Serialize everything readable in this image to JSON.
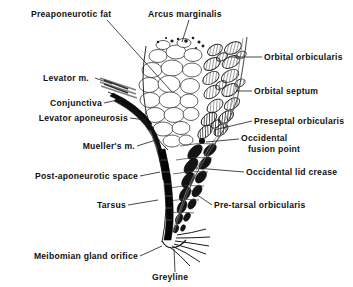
{
  "figure": {
    "background_color": "#ffffff",
    "ink_color": "#111111",
    "labels": {
      "preaponeurotic_fat": "Preaponeurotic fat",
      "arcus_marginalis": "Arcus marginalis",
      "orbital_orbicularis": "Orbital orbicularis",
      "orbital_septum": "Orbital septum",
      "levator_muscle": "Levator m.",
      "conjunctiva": "Conjunctiva",
      "levator_aponeurosis": "Levator aponeurosis",
      "preseptal_orbicularis": "Preseptal orbicularis",
      "muellers_muscle": "Mueller's m.",
      "occidental_fusion_point_line1": "Occidental",
      "occidental_fusion_point_line2": "fusion point",
      "post_aponeurotic_space": "Post-aponeurotic space",
      "occidental_lid_crease": "Occidental lid crease",
      "tarsus": "Tarsus",
      "pre_tarsal_orbicularis": "Pre-tarsal orbicularis",
      "meibomian_gland_orifice": "Meibomian gland orifice",
      "greyline": "Greyline"
    },
    "structures": [
      {
        "name": "preaponeurotic-fat",
        "render": "lobulated fat cells, outline only"
      },
      {
        "name": "orbital-orbicularis",
        "render": "hatched muscle bundles, upper"
      },
      {
        "name": "preseptal-orbicularis",
        "render": "hatched muscle bundles, middle"
      },
      {
        "name": "pre-tarsal-orbicularis",
        "render": "solid dark muscle bundles, lower"
      },
      {
        "name": "orbital-septum",
        "render": "thin curved line along anterior border"
      },
      {
        "name": "levator-aponeurosis",
        "render": "dark tapering band"
      },
      {
        "name": "muellers-muscle",
        "render": "thin band posterior to aponeurosis"
      },
      {
        "name": "tarsus",
        "render": "dense black vertical plate"
      },
      {
        "name": "eyelashes",
        "render": "radiating curved lashes at lid margin"
      }
    ]
  }
}
